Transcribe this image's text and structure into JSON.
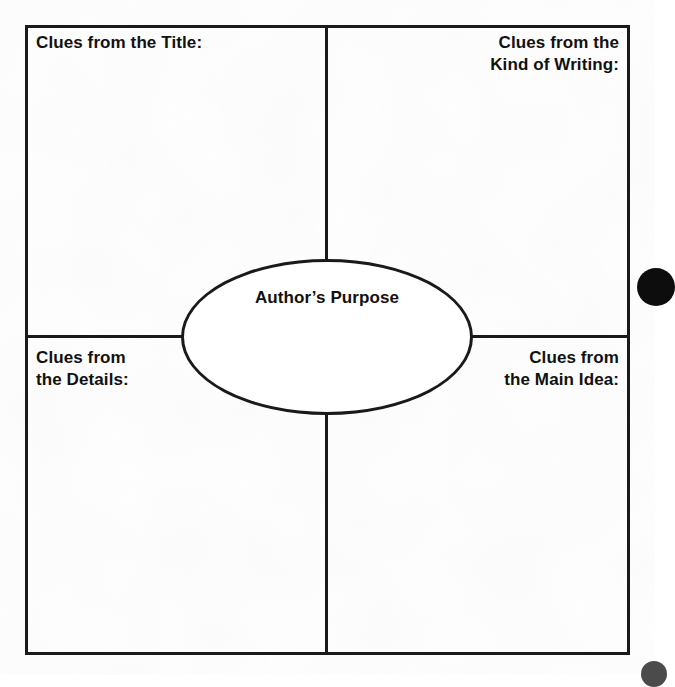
{
  "worksheet": {
    "type": "author's-purpose-graphic-organizer",
    "center": {
      "label": "Author’s Purpose"
    },
    "quadrants": [
      {
        "id": "top-left",
        "name": "clues-from-the-title",
        "lines": [
          "Clues from the Title:"
        ],
        "align": "left"
      },
      {
        "id": "top-right",
        "name": "clues-from-the-kind-of-writing",
        "lines": [
          "Clues from the",
          "Kind of Writing:"
        ],
        "align": "right"
      },
      {
        "id": "bottom-left",
        "name": "clues-from-the-details",
        "lines": [
          "Clues from",
          "the Details:"
        ],
        "align": "left"
      },
      {
        "id": "bottom-right",
        "name": "clues-from-the-main-idea",
        "lines": [
          "Clues from",
          "the Main Idea:"
        ],
        "align": "right"
      }
    ],
    "colors": {
      "ink": "#1a1a1a",
      "text": "#111111",
      "paper": "#ffffff",
      "mark": "#0d0d0d"
    },
    "marks": [
      {
        "name": "edge-dot-right",
        "shape": "circle"
      },
      {
        "name": "edge-dot-corner",
        "shape": "circle"
      }
    ]
  }
}
